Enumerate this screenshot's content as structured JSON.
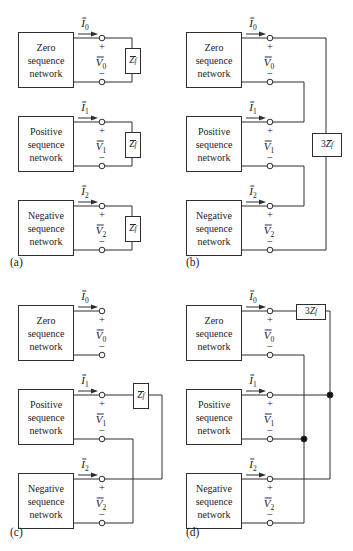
{
  "networks": {
    "zero": "Zero\nsequence\nnetwork",
    "positive": "Positive\nsequence\nnetwork",
    "negative": "Negative\nsequence\nnetwork"
  },
  "labels": {
    "I0": {
      "base": "I",
      "sub": "0"
    },
    "I1": {
      "base": "I",
      "sub": "1"
    },
    "I2": {
      "base": "I",
      "sub": "2"
    },
    "V0": {
      "base": "V",
      "sub": "0"
    },
    "V1": {
      "base": "V",
      "sub": "1"
    },
    "V2": {
      "base": "V",
      "sub": "2"
    }
  },
  "impedances": {
    "Zf": {
      "base": "Z",
      "sub": "f"
    },
    "threeZf_bar": {
      "coeff": "3",
      "base": "Z",
      "sub": "f"
    },
    "threeZf": {
      "coeff": "3",
      "base": "Z",
      "sub": "f"
    }
  },
  "signs": {
    "plus": "+",
    "minus": "−"
  },
  "panel_labels": {
    "a": "(a)",
    "b": "(b)",
    "c": "(c)",
    "d": "(d)"
  },
  "colors": {
    "ink": "#2e2e2e",
    "paper": "#ffffff"
  }
}
